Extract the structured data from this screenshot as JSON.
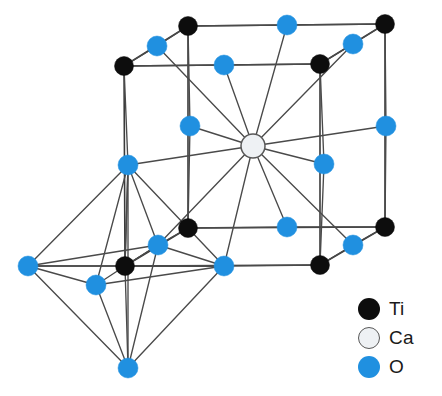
{
  "figure": {
    "name": "perovskite-crystal-structure"
  },
  "colors": {
    "titanium": "#0d0d0d",
    "calcium": "#eef1f4",
    "calcium_outline": "#585858",
    "oxygen": "#2090e0",
    "bond": "#3a3a3a",
    "background": "#ffffff"
  },
  "legend": {
    "name": "element-legend",
    "items": [
      {
        "symbol": "Ti",
        "element": "titanium",
        "swatch": "ti-swatch-icon"
      },
      {
        "symbol": "Ca",
        "element": "calcium",
        "swatch": "ca-swatch-icon"
      },
      {
        "symbol": "O",
        "element": "oxygen",
        "swatch": "o-swatch-icon"
      }
    ]
  },
  "structure": {
    "atoms": [
      {
        "id": "ti-back-top-left",
        "element": "Ti",
        "x": 188,
        "y": 26,
        "r": 9.5
      },
      {
        "id": "ti-back-top-right",
        "element": "Ti",
        "x": 385,
        "y": 24,
        "r": 9.5
      },
      {
        "id": "ti-front-top-left",
        "element": "Ti",
        "x": 124,
        "y": 66,
        "r": 9.5
      },
      {
        "id": "ti-front-top-right",
        "element": "Ti",
        "x": 320,
        "y": 64,
        "r": 9.5
      },
      {
        "id": "ti-back-bot-left",
        "element": "Ti",
        "x": 188,
        "y": 228,
        "r": 9.5
      },
      {
        "id": "ti-back-bot-right",
        "element": "Ti",
        "x": 385,
        "y": 227,
        "r": 9.5
      },
      {
        "id": "ti-front-bot-left",
        "element": "Ti",
        "x": 125,
        "y": 266,
        "r": 9.5
      },
      {
        "id": "ti-front-bot-right",
        "element": "Ti",
        "x": 320,
        "y": 265,
        "r": 9.5
      },
      {
        "id": "o-top-back-edge",
        "element": "O",
        "x": 287,
        "y": 25,
        "r": 10
      },
      {
        "id": "o-top-left-edge",
        "element": "O",
        "x": 157,
        "y": 46,
        "r": 10
      },
      {
        "id": "o-top-right-edge",
        "element": "O",
        "x": 353,
        "y": 44,
        "r": 10
      },
      {
        "id": "o-top-front-edge",
        "element": "O",
        "x": 224,
        "y": 65,
        "r": 10
      },
      {
        "id": "o-mid-left-upper",
        "element": "O",
        "x": 190,
        "y": 126,
        "r": 10
      },
      {
        "id": "o-mid-right-upper",
        "element": "O",
        "x": 386,
        "y": 126,
        "r": 10
      },
      {
        "id": "o-mid-left",
        "element": "O",
        "x": 128,
        "y": 165,
        "r": 10
      },
      {
        "id": "o-mid-right",
        "element": "O",
        "x": 324,
        "y": 164,
        "r": 10
      },
      {
        "id": "o-bot-back-edge",
        "element": "O",
        "x": 287,
        "y": 227,
        "r": 10
      },
      {
        "id": "o-bot-right-edge",
        "element": "O",
        "x": 353,
        "y": 245,
        "r": 10
      },
      {
        "id": "o-bot-left-edge",
        "element": "O",
        "x": 158,
        "y": 245,
        "r": 10
      },
      {
        "id": "o-bot-front-edge",
        "element": "O",
        "x": 224,
        "y": 266,
        "r": 10
      },
      {
        "id": "o-oct-left",
        "element": "O",
        "x": 28,
        "y": 266,
        "r": 10
      },
      {
        "id": "o-oct-front",
        "element": "O",
        "x": 96,
        "y": 285,
        "r": 10
      },
      {
        "id": "o-oct-bottom",
        "element": "O",
        "x": 128,
        "y": 368,
        "r": 10
      },
      {
        "id": "ca-center",
        "element": "Ca",
        "x": 253,
        "y": 146,
        "r": 12
      }
    ],
    "cube_edges": [
      [
        "ti-back-top-left",
        "ti-back-top-right"
      ],
      [
        "ti-front-top-left",
        "ti-front-top-right"
      ],
      [
        "ti-back-top-left",
        "ti-front-top-left"
      ],
      [
        "ti-back-top-right",
        "ti-front-top-right"
      ],
      [
        "ti-back-bot-left",
        "ti-back-bot-right"
      ],
      [
        "ti-front-bot-left",
        "ti-front-bot-right"
      ],
      [
        "ti-back-bot-left",
        "ti-front-bot-left"
      ],
      [
        "ti-back-bot-right",
        "ti-front-bot-right"
      ],
      [
        "ti-back-top-left",
        "ti-back-bot-left"
      ],
      [
        "ti-back-top-right",
        "ti-back-bot-right"
      ],
      [
        "ti-front-top-left",
        "ti-front-bot-left"
      ],
      [
        "ti-front-top-right",
        "ti-front-bot-right"
      ]
    ],
    "ca_bonds": [
      "o-top-back-edge",
      "o-top-left-edge",
      "o-top-right-edge",
      "o-top-front-edge",
      "o-mid-left-upper",
      "o-mid-right-upper",
      "o-mid-left",
      "o-mid-right",
      "o-bot-back-edge",
      "o-bot-right-edge",
      "o-bot-left-edge",
      "o-bot-front-edge"
    ],
    "octahedron": {
      "center": "ti-front-bot-left",
      "vertices": [
        "o-mid-left",
        "o-oct-left",
        "o-oct-front",
        "o-bot-left-edge",
        "o-bot-front-edge",
        "o-oct-bottom"
      ],
      "edges": [
        [
          "o-mid-left",
          "o-oct-left"
        ],
        [
          "o-mid-left",
          "o-oct-front"
        ],
        [
          "o-mid-left",
          "o-bot-left-edge"
        ],
        [
          "o-mid-left",
          "o-bot-front-edge"
        ],
        [
          "o-oct-left",
          "o-oct-front"
        ],
        [
          "o-oct-left",
          "o-bot-left-edge"
        ],
        [
          "o-oct-front",
          "o-bot-front-edge"
        ],
        [
          "o-bot-left-edge",
          "o-bot-front-edge"
        ],
        [
          "o-oct-bottom",
          "o-oct-left"
        ],
        [
          "o-oct-bottom",
          "o-oct-front"
        ],
        [
          "o-oct-bottom",
          "o-bot-left-edge"
        ],
        [
          "o-oct-bottom",
          "o-bot-front-edge"
        ],
        [
          "o-mid-left",
          "o-oct-bottom"
        ],
        [
          "o-oct-left",
          "o-bot-front-edge"
        ]
      ]
    }
  }
}
